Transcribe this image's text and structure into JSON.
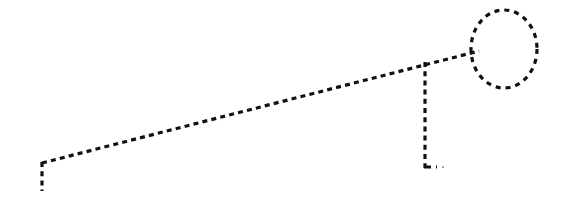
{
  "canvas": {
    "width": 579,
    "height": 224,
    "background_color": "#ffffff",
    "title": "Dashed line sketch"
  },
  "style": {
    "stroke_color": "#101010",
    "stroke_width": 3.2,
    "dash_length": 5,
    "gap_length": 4.2,
    "dash_array": "5 4.2",
    "line_cap": "butt"
  },
  "shapes": {
    "diagonal_line": {
      "name": "long-dashed-diagonal",
      "x1": 42,
      "y1": 163,
      "x2": 479,
      "y2": 51
    },
    "left_tail": {
      "name": "left-vertical-tail",
      "x1": 42,
      "y1": 162,
      "x2": 42,
      "y2": 191
    },
    "vertical_line": {
      "name": "vertical-dashed-stem",
      "x1": 425,
      "y1": 62,
      "x2": 425,
      "y2": 168
    },
    "stem_foot": {
      "name": "stem-foot",
      "x1": 424,
      "y1": 167,
      "x2": 437,
      "y2": 167
    },
    "stray_dot": {
      "name": "stray-dot",
      "cx": 443,
      "cy": 167,
      "r": 1.1,
      "opacity": 0.45
    },
    "circle": {
      "name": "dashed-circle-head",
      "cx": 504,
      "cy": 49,
      "rx": 33,
      "ry": 39
    }
  }
}
